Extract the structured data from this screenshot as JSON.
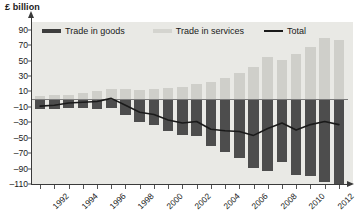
{
  "axis": {
    "y_title": "£ billion",
    "y_ticks": [
      90,
      70,
      50,
      30,
      10,
      -10,
      -30,
      -50,
      -70,
      -90,
      -110
    ],
    "y_tick_labels": [
      "90",
      "70",
      "50",
      "30",
      "10",
      "–10",
      "–30",
      "–50",
      "–70",
      "–90",
      "–110"
    ],
    "x_tick_labels": [
      "1992",
      "1994",
      "1996",
      "1998",
      "2000",
      "2002",
      "2004",
      "2006",
      "2008",
      "2010",
      "2012"
    ]
  },
  "legend": {
    "goods_label": "Trade in goods",
    "services_label": "Trade in services",
    "total_label": "Total"
  },
  "colors": {
    "goods": "#4d4d4d",
    "services": "#cfcfca",
    "total_line": "#1a1a1a",
    "plot_background": "#e9e9e5",
    "axis": "#3a3a3a"
  },
  "chart_data": {
    "type": "bar",
    "title": "",
    "subtitle": "",
    "xlabel": "",
    "ylabel": "£ billion",
    "ylim": [
      -110,
      100
    ],
    "grid": false,
    "legend_position": "top",
    "categories": [
      "1992",
      "1993",
      "1994",
      "1995",
      "1996",
      "1997",
      "1998",
      "1999",
      "2000",
      "2001",
      "2002",
      "2003",
      "2004",
      "2005",
      "2006",
      "2007",
      "2008",
      "2009",
      "2010",
      "2011",
      "2012",
      "2013"
    ],
    "series": [
      {
        "name": "Trade in goods",
        "type": "bar",
        "values": [
          -13,
          -13,
          -11,
          -12,
          -13,
          -12,
          -21,
          -29,
          -33,
          -41,
          -47,
          -48,
          -61,
          -69,
          -76,
          -89,
          -93,
          -82,
          -98,
          -100,
          -108,
          -110
        ]
      },
      {
        "name": "Trade in services",
        "type": "bar",
        "values": [
          4,
          5,
          6,
          8,
          10,
          13,
          13,
          12,
          13,
          14,
          16,
          19,
          22,
          28,
          34,
          42,
          55,
          51,
          58,
          67,
          79,
          77
        ]
      },
      {
        "name": "Total",
        "type": "line",
        "values": [
          -9,
          -8,
          -5,
          -4,
          -3,
          1,
          -8,
          -17,
          -20,
          -27,
          -31,
          -29,
          -39,
          -41,
          -42,
          -47,
          -38,
          -31,
          -40,
          -33,
          -29,
          -33
        ]
      }
    ]
  }
}
